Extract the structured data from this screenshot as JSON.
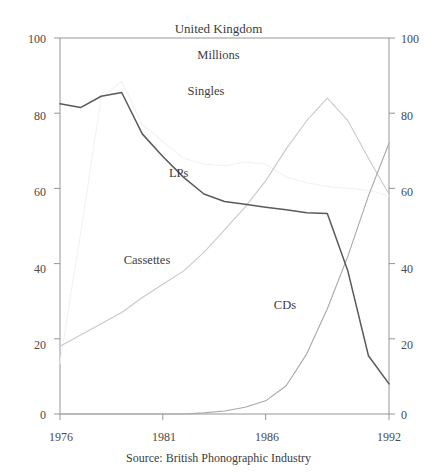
{
  "chart_data": {
    "type": "line",
    "title": "United Kingdom",
    "subtitle": "Millions",
    "source": "Source: British Phonographic Industry",
    "xlabel": "",
    "ylabel": "",
    "xlim": [
      1976,
      1992
    ],
    "ylim": [
      0,
      100
    ],
    "grid": false,
    "legend_position": "inline-annotations",
    "x_ticks": [
      "1976",
      "1981",
      "1986",
      "1992"
    ],
    "x_tick_values": [
      1976,
      1981,
      1986,
      1992
    ],
    "y_ticks": [
      "0",
      "20",
      "40",
      "60",
      "80",
      "100"
    ],
    "y_tick_values": [
      0,
      20,
      40,
      60,
      80,
      100
    ],
    "y_ticks_right": [
      "0",
      "20",
      "40",
      "60",
      "80",
      "100"
    ],
    "x": [
      1976,
      1977,
      1978,
      1979,
      1980,
      1981,
      1982,
      1983,
      1984,
      1985,
      1986,
      1987,
      1988,
      1989,
      1990,
      1991,
      1992
    ],
    "series": [
      {
        "name": "LPs",
        "color": "#5a5a5a",
        "label_x": 1981.3,
        "label_y": 64,
        "values": [
          82.5,
          81.5,
          84.5,
          85.5,
          74.5,
          68.5,
          63.0,
          58.5,
          56.5,
          55.8,
          55.0,
          54.3,
          53.5,
          53.3,
          38.0,
          15.5,
          8.0
        ]
      },
      {
        "name": "Singles",
        "color": "#f2f2f2",
        "label_x": 1982.2,
        "label_y": 86,
        "values": [
          13.5,
          48.0,
          84.0,
          88.5,
          77.0,
          72.5,
          68.0,
          66.5,
          66.0,
          67.0,
          66.5,
          63.0,
          61.5,
          60.5,
          60.0,
          59.5,
          58.0
        ]
      },
      {
        "name": "Cassettes",
        "color": "#c9c9c9",
        "label_x": 1979.1,
        "label_y": 41,
        "values": [
          18.0,
          21.0,
          24.0,
          27.0,
          31.0,
          34.5,
          38.0,
          43.0,
          49.0,
          55.0,
          62.0,
          70.5,
          78.0,
          84.0,
          78.0,
          68.0,
          58.5
        ]
      },
      {
        "name": "CDs",
        "color": "#a8a8a8",
        "label_x": 1986.4,
        "label_y": 29,
        "values": [
          0,
          0,
          0,
          0,
          0,
          0,
          0,
          0.3,
          0.8,
          1.8,
          3.5,
          7.5,
          16.0,
          28.0,
          42.0,
          58.0,
          72.0
        ]
      }
    ],
    "axis_color": "#8a8a8a"
  }
}
